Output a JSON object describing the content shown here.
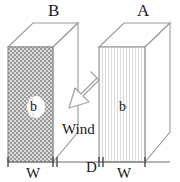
{
  "figure": {
    "background_color": "#ffffff",
    "line_color": "#8c8c8c",
    "text_color": "#1a1a1a"
  },
  "buildings": [
    {
      "id": "left",
      "top_label": "B",
      "face_label": "b",
      "width_label": "W",
      "pattern": "checkerboard",
      "pattern_color": "#9a9a9a",
      "face_fill": "#d8d8d8"
    },
    {
      "id": "right",
      "top_label": "A",
      "face_label": "b",
      "width_label": "W",
      "pattern": "vertical-stripes",
      "pattern_color": "#d9d9d9",
      "face_fill": "#fafafa"
    }
  ],
  "wind": {
    "label": "Wind",
    "direction": "down-left",
    "angle_degrees": 225,
    "arrow_fill": "#ffffff",
    "arrow_stroke": "#9a9a9a"
  },
  "dimensions": {
    "left_width": "W",
    "gap": "D",
    "right_width": "W"
  }
}
